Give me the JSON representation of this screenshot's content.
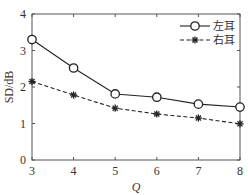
{
  "chart_data": {
    "type": "line",
    "title": "",
    "xlabel": "Q",
    "ylabel": "SD/dB",
    "x": [
      3,
      4,
      5,
      6,
      7,
      8
    ],
    "xlim": [
      3,
      8
    ],
    "ylim": [
      0,
      4
    ],
    "xticks": [
      3,
      4,
      5,
      6,
      7,
      8
    ],
    "yticks": [
      0,
      1,
      2,
      3,
      4
    ],
    "grid": false,
    "legend_position": "upper right",
    "series": [
      {
        "name": "左耳",
        "marker": "circle",
        "line": "solid",
        "values": [
          3.3,
          2.52,
          1.81,
          1.72,
          1.53,
          1.45
        ]
      },
      {
        "name": "右耳",
        "marker": "star",
        "line": "dashed",
        "values": [
          2.15,
          1.78,
          1.42,
          1.26,
          1.15,
          0.99
        ]
      }
    ]
  },
  "colors": {
    "line": "#222222",
    "axis": "#555555"
  }
}
